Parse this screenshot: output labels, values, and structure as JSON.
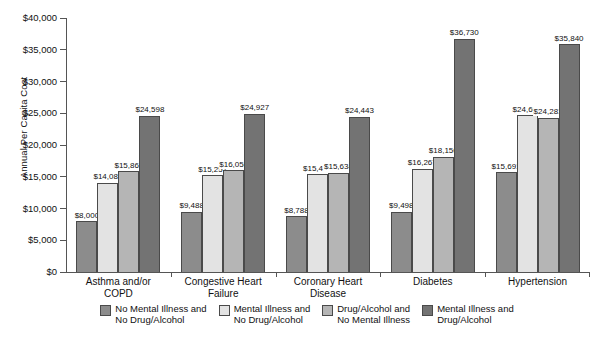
{
  "chart_data": {
    "type": "bar",
    "title": "",
    "xlabel": "",
    "ylabel": "Annual Per Capita Cost",
    "ylim": [
      0,
      40000
    ],
    "ytick_labels": [
      "$0",
      "$5,000",
      "$10,000",
      "$15,000",
      "$20,000",
      "$25,000",
      "$30,000",
      "$35,000",
      "$40,000"
    ],
    "ytick_values": [
      0,
      5000,
      10000,
      15000,
      20000,
      25000,
      30000,
      35000,
      40000
    ],
    "grid": false,
    "legend_position": "bottom",
    "categories": [
      "Asthma and/or\nCOPD",
      "Congestive Heart\nFailure",
      "Coronary Heart\nDisease",
      "Diabetes",
      "Hypertension"
    ],
    "series": [
      {
        "name": "No Mental Illness and\nNo Drug/Alcohol",
        "color": "#8c8c8c",
        "values": [
          8000,
          9488,
          8788,
          9498,
          15691
        ],
        "labels": [
          "$8,000",
          "$9,488",
          "$8,788",
          "$9,498",
          "$15,691"
        ]
      },
      {
        "name": "Mental Illness and\nNo Drug/Alcohol",
        "color": "#e3e3e3",
        "values": [
          14081,
          15257,
          15430,
          16267,
          24693
        ],
        "labels": [
          "$14,081",
          "$15,257",
          "$15,430",
          "$16,267",
          "$24,693"
        ]
      },
      {
        "name": "Drug/Alcohol and\nNo Mental Illness",
        "color": "#b5b5b5",
        "values": [
          15862,
          16058,
          15634,
          18156,
          24281
        ],
        "labels": [
          "$15,862",
          "$16,058",
          "$15,634",
          "$18,156",
          "$24,281"
        ]
      },
      {
        "name": "Mental Illness and\nDrug/Alcohol",
        "color": "#737373",
        "values": [
          24598,
          24927,
          24443,
          36730,
          35840
        ],
        "labels": [
          "$24,598",
          "$24,927",
          "$24,443",
          "$36,730",
          "$35,840"
        ]
      }
    ]
  }
}
